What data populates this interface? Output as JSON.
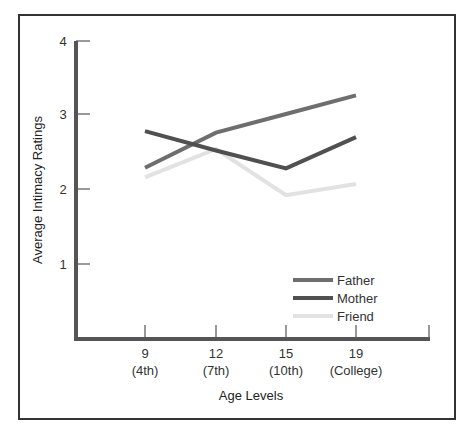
{
  "chart_data": {
    "type": "line",
    "title": "",
    "xlabel": "Age Levels",
    "ylabel": "Average Intimacy Ratings",
    "ylim": [
      0,
      4
    ],
    "yticks": [
      1,
      2,
      3,
      4
    ],
    "grid": false,
    "legend_position": "lower right",
    "categories": [
      "9 (4th)",
      "12 (7th)",
      "15 (10th)",
      "19 (College)"
    ],
    "x_tick_labels": [
      {
        "age": "9",
        "grade": "(4th)"
      },
      {
        "age": "12",
        "grade": "(7th)"
      },
      {
        "age": "15",
        "grade": "(10th)"
      },
      {
        "age": "19",
        "grade": "(College)"
      }
    ],
    "series": [
      {
        "name": "Father",
        "color": "#6e6e6e",
        "values": [
          2.3,
          2.77,
          3.02,
          3.27
        ]
      },
      {
        "name": "Mother",
        "color": "#505050",
        "values": [
          2.79,
          2.53,
          2.29,
          2.71
        ]
      },
      {
        "name": "Friend",
        "color": "#e2e2e2",
        "values": [
          2.17,
          2.55,
          1.93,
          2.08
        ]
      }
    ]
  },
  "axis": {
    "y_tick_labels": [
      "1",
      "2",
      "3",
      "4"
    ],
    "x_title": "Age Levels",
    "y_title": "Average Intimacy Ratings"
  },
  "legend": {
    "items": [
      {
        "label": "Father",
        "color": "#6e6e6e"
      },
      {
        "label": "Mother",
        "color": "#505050"
      },
      {
        "label": "Friend",
        "color": "#e2e2e2"
      }
    ]
  }
}
